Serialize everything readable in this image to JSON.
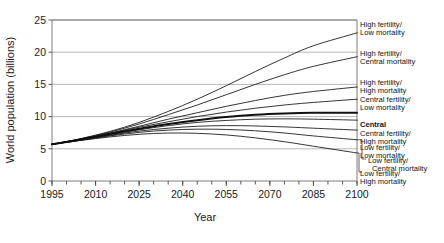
{
  "chart_data": {
    "type": "line",
    "title": "",
    "xlabel": "Year",
    "ylabel": "World population (billions)",
    "xlim": [
      1995,
      2100
    ],
    "ylim": [
      0,
      25
    ],
    "grid": true,
    "legend_position": "right-inline-labels",
    "x_major_ticks": [
      1995,
      2010,
      2025,
      2040,
      2055,
      2070,
      2085,
      2100
    ],
    "x_minor_tick_interval": 5,
    "y_ticks": [
      0,
      5,
      10,
      15,
      20,
      25
    ],
    "x": [
      1995,
      2005,
      2015,
      2025,
      2035,
      2045,
      2055,
      2065,
      2075,
      2085,
      2100
    ],
    "series": [
      {
        "name": "High fertility/ Low mortality",
        "label_line1": "High fertility/",
        "label_line2": "Low mortality",
        "emphasis": false,
        "values": [
          5.7,
          6.6,
          7.7,
          9.1,
          10.8,
          12.7,
          14.8,
          17.0,
          19.1,
          21.0,
          23.0
        ]
      },
      {
        "name": "High fertility/ Central mortality",
        "label_line1": "High fertility/",
        "label_line2": "Central mortality",
        "emphasis": false,
        "values": [
          5.7,
          6.55,
          7.6,
          8.85,
          10.3,
          11.8,
          13.4,
          15.0,
          16.5,
          17.8,
          19.3
        ]
      },
      {
        "name": "High fertility/ High mortality",
        "label_line1": "High fertility/",
        "label_line2": "High mortality",
        "emphasis": false,
        "values": [
          5.7,
          6.5,
          7.45,
          8.5,
          9.6,
          10.6,
          11.6,
          12.5,
          13.3,
          13.9,
          14.6
        ]
      },
      {
        "name": "Central fertility/ Low mortality",
        "label_line1": "Central fertility/",
        "label_line2": "Low mortality",
        "emphasis": false,
        "values": [
          5.7,
          6.5,
          7.4,
          8.35,
          9.2,
          10.0,
          10.7,
          11.3,
          11.8,
          12.2,
          12.7
        ]
      },
      {
        "name": "Central",
        "label_line1": "Central",
        "label_line2": "",
        "emphasis": true,
        "values": [
          5.7,
          6.45,
          7.3,
          8.1,
          8.85,
          9.45,
          9.95,
          10.3,
          10.5,
          10.6,
          10.6
        ]
      },
      {
        "name": "Central fertility/ High mortality",
        "label_line1": "Central fertility/",
        "label_line2": "High mortality",
        "emphasis": false,
        "values": [
          5.7,
          6.4,
          7.2,
          7.95,
          8.6,
          9.1,
          9.4,
          9.6,
          9.65,
          9.6,
          9.45
        ]
      },
      {
        "name": "Low fertility/ Low mortality",
        "label_line1": "Low fertility/",
        "label_line2": "Low mortality",
        "emphasis": false,
        "values": [
          5.7,
          6.4,
          7.1,
          7.75,
          8.2,
          8.5,
          8.6,
          8.55,
          8.4,
          8.2,
          7.9
        ]
      },
      {
        "name": "Low fertility/ Central mortality",
        "label_line1": "Low fertility/",
        "label_line2": "Central mortality",
        "emphasis": false,
        "values": [
          5.7,
          6.35,
          7.0,
          7.55,
          7.9,
          8.05,
          8.0,
          7.8,
          7.45,
          7.0,
          6.4
        ]
      },
      {
        "name": "Low fertility/ High mortality",
        "label_line1": "Low fertility/",
        "label_line2": "High mortality",
        "emphasis": false,
        "values": [
          5.7,
          6.3,
          6.85,
          7.25,
          7.45,
          7.4,
          7.15,
          6.7,
          6.1,
          5.4,
          4.35
        ]
      }
    ],
    "legend_entries": [
      {
        "line1": "High fertility/",
        "line2": "Low mortality",
        "bold": false
      },
      {
        "line1": "High fertility/",
        "line2": "Central mortality",
        "bold": false
      },
      {
        "line1": "High fertility/",
        "line2": "High mortality",
        "bold": false
      },
      {
        "line1": "Central fertility/",
        "line2": "Low mortality",
        "bold": false
      },
      {
        "line1": "Central",
        "line2": "",
        "bold": true
      },
      {
        "line1": "Central fertility/",
        "line2": "High mortality",
        "bold": false
      },
      {
        "line1": "Low fertility/",
        "line2": "Low mortality",
        "bold": false
      },
      {
        "line1": "Low fertility/",
        "line2": "Central mortality",
        "bold": false
      },
      {
        "line1": "Low fertility/",
        "line2": "High mortality",
        "bold": false
      }
    ],
    "colors": {
      "line": "#111111",
      "grid": "#9a9a9a",
      "frame": "#6d6d6d",
      "text": "#1a1a1a",
      "background": "#ffffff"
    }
  }
}
